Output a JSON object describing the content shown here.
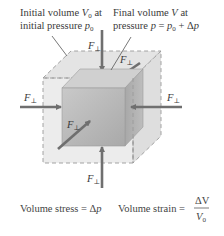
{
  "labels": {
    "initial": {
      "line1_prefix": "Initial volume ",
      "line1_var": "V",
      "line1_sub": "0",
      "line1_suffix": " at",
      "line2_prefix": "initial pressure ",
      "line2_var": "p",
      "line2_sub": "0"
    },
    "final": {
      "line1_prefix": "Final volume ",
      "line1_var": "V",
      "line1_suffix": " at",
      "line2_prefix": "pressure ",
      "line2_var_p": "p",
      "line2_eq": " = ",
      "line2_var_p0": "p",
      "line2_sub": "0",
      "line2_plus": " + Δ",
      "line2_var_dp": "p"
    }
  },
  "forces": {
    "symbol": "F",
    "subscript": "⊥",
    "arrows": [
      "top",
      "back",
      "left",
      "right",
      "front",
      "bottom"
    ]
  },
  "captions": {
    "stress_prefix": "Volume stress = Δ",
    "stress_var": "p",
    "strain_prefix": "Volume strain = ",
    "strain_num": "ΔV",
    "strain_den_var": "V",
    "strain_den_sub": "0"
  },
  "colors": {
    "arrow": "#6f6f6f",
    "cube_front": "#b9b9b9",
    "cube_top": "#d2d2d2",
    "cube_side": "#a4a4a4",
    "outer_fill": "#e6e6e6",
    "dash": "#9a9a9a"
  }
}
